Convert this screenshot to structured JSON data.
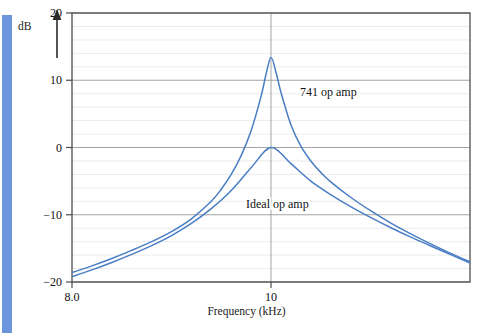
{
  "figure": {
    "axis_arrow_label": "dB",
    "x_axis_title": "Frequency (kHz)",
    "stripe_color": "#6d95de",
    "curve_color": "#4a7ec4",
    "grid_color": "#e2e2e2",
    "major_grid_color": "#9a9a9a",
    "frame_color": "#4d4d4d"
  },
  "annotations": [
    {
      "text": "741 op amp",
      "x": 300,
      "y": 86
    },
    {
      "text": "Ideal op amp",
      "x": 246,
      "y": 198
    }
  ],
  "chart_data": {
    "type": "line",
    "title": "",
    "xlabel": "Frequency (kHz)",
    "ylabel": "dB",
    "xlim": [
      8.0,
      12.0
    ],
    "ylim": [
      -20,
      20
    ],
    "grid": true,
    "minor_grid_step": 2,
    "legend_position": "inline-annotations",
    "xticks": [
      {
        "value": 8.0,
        "label": "8.0"
      },
      {
        "value": 10,
        "label": "10"
      }
    ],
    "yticks": [
      {
        "value": -20,
        "label": "-20"
      },
      {
        "value": -10,
        "label": "-10"
      },
      {
        "value": 0,
        "label": "0"
      },
      {
        "value": 10,
        "label": "10"
      },
      {
        "value": 20,
        "label": "20"
      }
    ],
    "series": [
      {
        "name": "741 op amp",
        "peak_x": 10,
        "peak_y": 13.5,
        "x": [
          8.0,
          8.2,
          8.4,
          8.6,
          8.8,
          9.0,
          9.2,
          9.4,
          9.5,
          9.6,
          9.7,
          9.8,
          9.9,
          9.95,
          10.0,
          10.05,
          10.1,
          10.2,
          10.3,
          10.4,
          10.5,
          10.6,
          10.8,
          11.0,
          11.2,
          11.4,
          11.6,
          11.8,
          12.0
        ],
        "values": [
          -18.6,
          -17.6,
          -16.5,
          -15.3,
          -14.0,
          -12.5,
          -10.6,
          -8.0,
          -6.2,
          -4.0,
          -1.2,
          2.5,
          7.6,
          10.9,
          13.4,
          11.2,
          8.2,
          3.4,
          0.2,
          -2.0,
          -3.7,
          -5.1,
          -7.4,
          -9.4,
          -11.2,
          -12.8,
          -14.3,
          -15.7,
          -17.0
        ]
      },
      {
        "name": "Ideal op amp",
        "peak_x": 10,
        "peak_y": 0.0,
        "x": [
          8.0,
          8.2,
          8.4,
          8.6,
          8.8,
          9.0,
          9.2,
          9.4,
          9.6,
          9.8,
          10.0,
          10.2,
          10.4,
          10.6,
          10.8,
          11.0,
          11.2,
          11.4,
          11.6,
          11.8,
          12.0
        ],
        "values": [
          -19.2,
          -18.2,
          -17.1,
          -15.9,
          -14.6,
          -13.1,
          -11.3,
          -9.1,
          -6.4,
          -3.0,
          0.0,
          -2.4,
          -5.0,
          -7.0,
          -8.8,
          -10.4,
          -11.9,
          -13.3,
          -14.6,
          -15.9,
          -17.2
        ]
      }
    ]
  }
}
